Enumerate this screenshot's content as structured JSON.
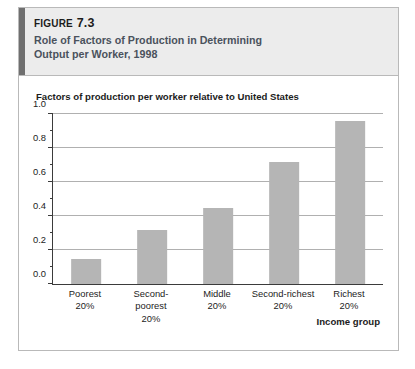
{
  "figure": {
    "number_prefix": "Figure",
    "number": "7.3",
    "title_line1": "Role of Factors of Production in Determining",
    "title_line2": "Output per Worker, 1998",
    "accent_color": "#6f6f6f",
    "header_bg": "#ececec"
  },
  "chart_data": {
    "type": "bar",
    "title": "Factors of production per worker relative to United States",
    "categories": [
      "Poorest\n20%",
      "Second-poorest\n20%",
      "Middle\n20%",
      "Second-richest\n20%",
      "Richest\n20%"
    ],
    "category_names": [
      "Poorest",
      "Second-poorest",
      "Middle",
      "Second-richest",
      "Richest"
    ],
    "category_share": "20%",
    "values": [
      0.15,
      0.32,
      0.45,
      0.72,
      0.96
    ],
    "xlabel": "Income group",
    "ylabel": "",
    "ylim": [
      0.0,
      1.0
    ],
    "ytick_labels": [
      "0.0",
      "0.2",
      "0.4",
      "0.6",
      "0.8",
      "1.0"
    ],
    "ytick_values": [
      0.0,
      0.2,
      0.4,
      0.6,
      0.8,
      1.0
    ],
    "yminor_values": [
      0.1,
      0.3,
      0.5,
      0.7,
      0.9
    ],
    "grid": true,
    "legend": false,
    "bar_color": "#b5b5b5",
    "grid_color": "#b0b0b0",
    "axis_color": "#3b3b3b"
  }
}
